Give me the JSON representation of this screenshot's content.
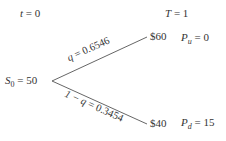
{
  "diagram": {
    "type": "binomial-tree",
    "time_labels": {
      "start": {
        "var": "t",
        "eq": " = 0"
      },
      "end": {
        "var": "T",
        "eq": " = 1"
      }
    },
    "root": {
      "var": "S",
      "sub": "0",
      "eq": " = 50"
    },
    "up": {
      "price": "$60",
      "payoff_var": "P",
      "payoff_sub": "u",
      "payoff_eq": " = 0",
      "prob_var": "q",
      "prob_eq": " = 0.6546"
    },
    "down": {
      "price": "$40",
      "payoff_var": "P",
      "payoff_sub": "d",
      "payoff_eq": " = 15",
      "prob_prefix": "1 − ",
      "prob_var": "q",
      "prob_eq": " = 0.3454"
    },
    "colors": {
      "line": "#555555",
      "text": "#333333"
    }
  }
}
